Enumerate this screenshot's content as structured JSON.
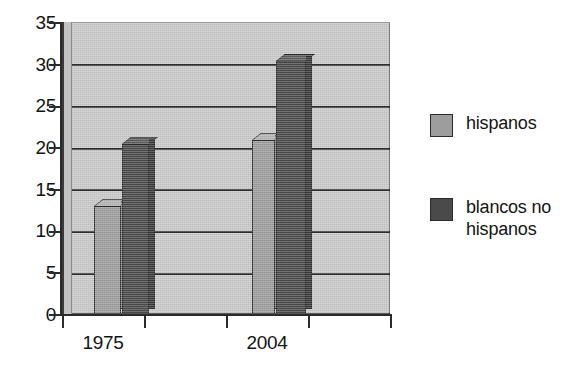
{
  "chart_data": {
    "type": "bar",
    "title": "",
    "subtitle": "",
    "xlabel": "",
    "ylabel": "",
    "categories": [
      "1975",
      "2004"
    ],
    "series": [
      {
        "name": "hispanos",
        "values": [
          13,
          21
        ],
        "color": "#9d9d9d"
      },
      {
        "name": "blancos no hispanos",
        "values": [
          20.5,
          30.5
        ],
        "color": "#4a4a4a"
      }
    ],
    "ylim": [
      0,
      35
    ],
    "ytick_labels": [
      "0",
      "5",
      "10",
      "15",
      "20",
      "25",
      "30",
      "35"
    ],
    "ytick_values": [
      0,
      5,
      10,
      15,
      20,
      25,
      30,
      35
    ],
    "grid": true,
    "grid_axis": "y",
    "legend_position": "right",
    "style": "3d-bar",
    "background_color": "#c9c9c9",
    "axis_color": "#2b2b2b"
  },
  "legend": {
    "items": [
      {
        "label": "hispanos",
        "swatch": "light"
      },
      {
        "label": "blancos no\nhispanos",
        "swatch": "dark"
      }
    ]
  },
  "axes": {
    "y_ticks": [
      {
        "label": "35",
        "value": 35
      },
      {
        "label": "30",
        "value": 30
      },
      {
        "label": "25",
        "value": 25
      },
      {
        "label": "20",
        "value": 20
      },
      {
        "label": "15",
        "value": 15
      },
      {
        "label": "10",
        "value": 10
      },
      {
        "label": "5",
        "value": 5
      },
      {
        "label": "0",
        "value": 0
      }
    ],
    "x_ticks": [
      {
        "label": "1975"
      },
      {
        "label": "2004"
      }
    ]
  }
}
